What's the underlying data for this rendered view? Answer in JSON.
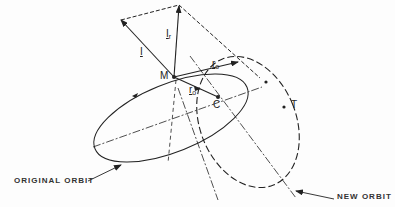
{
  "diagram": {
    "type": "orbital-geometry",
    "labels": {
      "impulse": "I",
      "impulse_radial": "I",
      "impulse_radial_sub": "r",
      "point_m": "M",
      "point_c": "C",
      "radius_primed": "r",
      "radius_primed_sub": "o",
      "radius": "r",
      "radius_sub": "o",
      "point_t": "T",
      "original_orbit": "ORIGINAL ORBIT",
      "new_orbit": "NEW ORBIT"
    },
    "colors": {
      "ink": "#222222",
      "background": "#fdfdfd"
    }
  }
}
